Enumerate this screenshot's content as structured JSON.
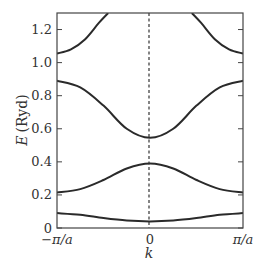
{
  "chart_data": {
    "type": "line",
    "title": "",
    "xlabel": "k",
    "ylabel": "E (Ryd)",
    "xlim": [
      -1,
      1
    ],
    "ylim": [
      0,
      1.3
    ],
    "x_unit": "pi/a",
    "xticks": [
      {
        "value": -1,
        "label": "−π/a"
      },
      {
        "value": 0,
        "label": "0"
      },
      {
        "value": 1,
        "label": "π/a"
      }
    ],
    "yticks": [
      {
        "value": 0,
        "label": "0"
      },
      {
        "value": 0.2,
        "label": "0.2"
      },
      {
        "value": 0.4,
        "label": "0.4"
      },
      {
        "value": 0.6,
        "label": "0.6"
      },
      {
        "value": 0.8,
        "label": "0.8"
      },
      {
        "value": 1.0,
        "label": "1.0"
      },
      {
        "value": 1.2,
        "label": "1.2"
      }
    ],
    "grid": false,
    "legend": null,
    "annotations": [
      {
        "type": "dashed-vertical-line",
        "x": 0
      }
    ],
    "series": [
      {
        "name": "band 1",
        "x": [
          -1,
          -0.75,
          -0.5,
          -0.25,
          0,
          0.25,
          0.5,
          0.75,
          1
        ],
        "y": [
          0.09,
          0.08,
          0.06,
          0.045,
          0.04,
          0.045,
          0.06,
          0.08,
          0.09
        ]
      },
      {
        "name": "band 2",
        "x": [
          -1,
          -0.75,
          -0.5,
          -0.25,
          0,
          0.25,
          0.5,
          0.75,
          1
        ],
        "y": [
          0.215,
          0.235,
          0.29,
          0.36,
          0.39,
          0.36,
          0.29,
          0.235,
          0.215
        ]
      },
      {
        "name": "band 3",
        "x": [
          -1,
          -0.75,
          -0.5,
          -0.25,
          0,
          0.25,
          0.5,
          0.75,
          1
        ],
        "y": [
          0.89,
          0.85,
          0.74,
          0.6,
          0.545,
          0.6,
          0.74,
          0.85,
          0.89
        ]
      },
      {
        "name": "band 4",
        "x": [
          -1,
          -0.85,
          -0.7,
          -0.55,
          -0.45,
          0.45,
          0.55,
          0.7,
          0.85,
          1
        ],
        "y": [
          1.055,
          1.08,
          1.14,
          1.24,
          1.3,
          1.3,
          1.24,
          1.14,
          1.08,
          1.055
        ]
      }
    ]
  },
  "labels": {
    "xlabel": "k",
    "ylabel_var": "E",
    "ylabel_unit": "(Ryd)"
  }
}
